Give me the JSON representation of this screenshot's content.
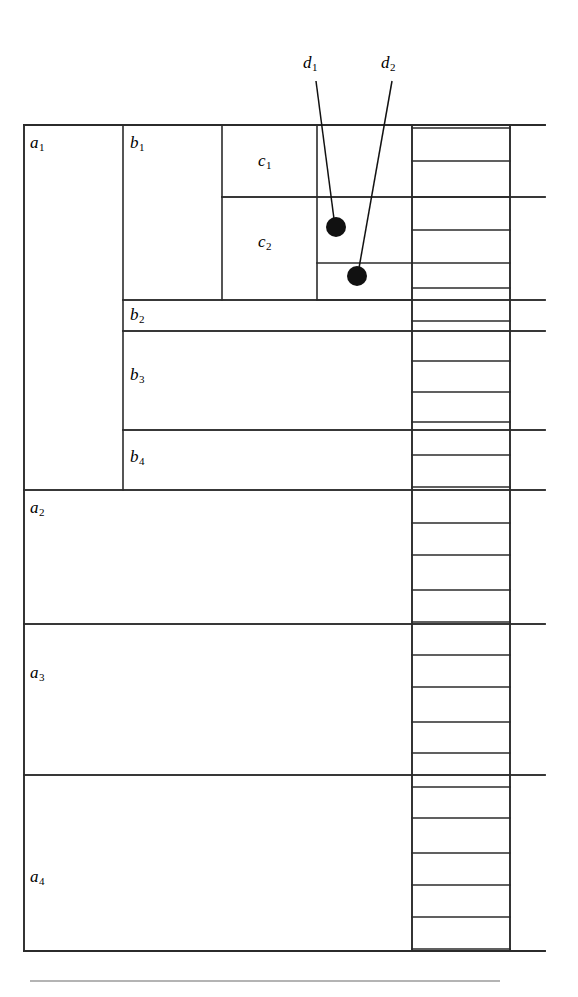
{
  "figure": {
    "background_color": "#ffffff",
    "line_color": "#2b2b2b",
    "dot_color": "#111111"
  },
  "labels": {
    "a1": "a",
    "a1_sub": "1",
    "a2": "a",
    "a2_sub": "2",
    "a3": "a",
    "a3_sub": "3",
    "a4": "a",
    "a4_sub": "4",
    "b1": "b",
    "b1_sub": "1",
    "b2": "b",
    "b2_sub": "2",
    "b3": "b",
    "b3_sub": "3",
    "b4": "b",
    "b4_sub": "4",
    "c1": "c",
    "c1_sub": "1",
    "c2": "c",
    "c2_sub": "2",
    "d1": "d",
    "d1_sub": "1",
    "d2": "d",
    "d2_sub": "2"
  },
  "chart_data": {
    "type": "diagram",
    "xlabel": "",
    "ylabel": "",
    "frame": {
      "x0": 24,
      "y0": 125,
      "x1": 510,
      "y1": 951
    },
    "columns": [
      {
        "name": "a",
        "x0": 24,
        "x1": 123
      },
      {
        "name": "b",
        "x0": 123,
        "x1": 222
      },
      {
        "name": "c",
        "x0": 222,
        "x1": 317
      },
      {
        "name": "d-points",
        "x0": 317,
        "x1": 412
      },
      {
        "name": "d-ticks",
        "x0": 412,
        "x1": 510
      }
    ],
    "extension_x": 545,
    "blocks_a": [
      {
        "label": "a1",
        "y0": 125,
        "y1": 490
      },
      {
        "label": "a2",
        "y0": 490,
        "y1": 624
      },
      {
        "label": "a3",
        "y0": 624,
        "y1": 775
      },
      {
        "label": "a4",
        "y0": 775,
        "y1": 951
      }
    ],
    "blocks_b": [
      {
        "label": "b1",
        "y0": 125,
        "y1": 300
      },
      {
        "label": "b2",
        "y0": 300,
        "y1": 331
      },
      {
        "label": "b3",
        "y0": 331,
        "y1": 430
      },
      {
        "label": "b4",
        "y0": 430,
        "y1": 490
      }
    ],
    "blocks_c": [
      {
        "label": "c1",
        "y0": 125,
        "y1": 197
      },
      {
        "label": "c2",
        "y0": 197,
        "y1": 300
      }
    ],
    "d_point_cell_splits": [
      263,
      300
    ],
    "d_tick_lines": [
      128,
      161,
      197,
      230,
      263,
      288,
      321,
      361,
      392,
      422,
      455,
      487,
      523,
      555,
      590,
      622,
      655,
      687,
      722,
      753,
      787,
      818,
      853,
      885,
      917,
      949
    ],
    "extended_lines_y": [
      125,
      197,
      300,
      331,
      430,
      490,
      624,
      775,
      951
    ],
    "points": [
      {
        "label": "d1",
        "x": 336,
        "y": 227,
        "r": 10
      },
      {
        "label": "d2",
        "x": 357,
        "y": 276,
        "r": 10
      }
    ],
    "leaders": [
      {
        "label": "d1",
        "from_x": 316,
        "from_y": 81,
        "to_x": 334,
        "to_y": 219
      },
      {
        "label": "d2",
        "from_x": 392,
        "from_y": 81,
        "to_x": 359,
        "to_y": 268
      }
    ],
    "footer_rule": {
      "x0": 30,
      "y": 981,
      "x1": 500
    }
  }
}
